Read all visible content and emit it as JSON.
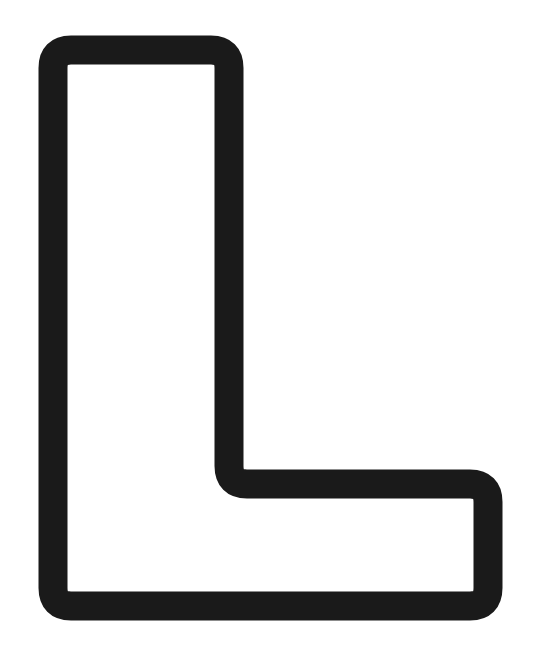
{
  "figure": {
    "shape": "letter-L-outline",
    "letter": "L",
    "stroke_color": "#1a1a1a",
    "fill_color": "#ffffff",
    "background": "#ffffff"
  }
}
